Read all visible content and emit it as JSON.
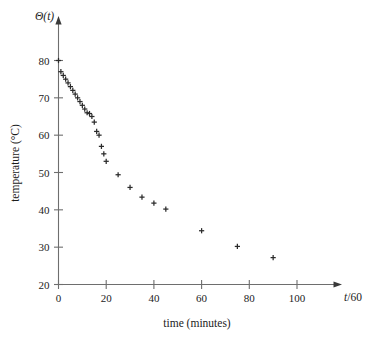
{
  "chart_data": {
    "type": "scatter",
    "title": "",
    "xlabel": "time (minutes)",
    "ylabel": "temperature (°C)",
    "x_axis_variable": "t/60",
    "y_axis_variable": "Θ(t)",
    "xlim": [
      0,
      115
    ],
    "ylim": [
      20,
      84
    ],
    "xticks": [
      0,
      20,
      40,
      60,
      80,
      100
    ],
    "xticklabels": [
      "0",
      "20",
      "40",
      "60",
      "80",
      "100"
    ],
    "yticks": [
      20,
      30,
      40,
      50,
      60,
      70,
      80
    ],
    "yticklabels": [
      "20",
      "30",
      "40",
      "50",
      "60",
      "70",
      "80"
    ],
    "grid": false,
    "legend": null,
    "marker": "plus",
    "marker_color": "#2b2b2b",
    "axis_color": "#6e6e6e",
    "x": [
      0,
      1,
      2,
      3,
      4,
      5,
      6,
      7,
      8,
      9,
      10,
      11,
      12,
      13,
      14,
      15,
      16,
      17,
      18,
      19,
      20,
      25,
      30,
      35,
      40,
      45,
      60,
      75,
      90
    ],
    "y": [
      80.0,
      77.0,
      76.0,
      75.0,
      74.0,
      73.0,
      72.0,
      71.0,
      70.0,
      69.0,
      68.0,
      67.0,
      66.0,
      65.8,
      65.0,
      63.5,
      61.0,
      60.0,
      57.0,
      55.0,
      53.0,
      49.4,
      46.0,
      43.4,
      41.8,
      40.2,
      34.4,
      30.2,
      27.2
    ],
    "series": [
      {
        "name": "temperature",
        "points": [
          {
            "t": 0,
            "T": 80.0
          },
          {
            "t": 1,
            "T": 77.0
          },
          {
            "t": 2,
            "T": 76.0
          },
          {
            "t": 3,
            "T": 75.0
          },
          {
            "t": 4,
            "T": 74.0
          },
          {
            "t": 5,
            "T": 73.0
          },
          {
            "t": 6,
            "T": 72.0
          },
          {
            "t": 7,
            "T": 71.0
          },
          {
            "t": 8,
            "T": 70.0
          },
          {
            "t": 9,
            "T": 69.0
          },
          {
            "t": 10,
            "T": 68.0
          },
          {
            "t": 11,
            "T": 67.0
          },
          {
            "t": 12,
            "T": 66.0
          },
          {
            "t": 13,
            "T": 65.8
          },
          {
            "t": 14,
            "T": 65.0
          },
          {
            "t": 15,
            "T": 63.5
          },
          {
            "t": 16,
            "T": 61.0
          },
          {
            "t": 17,
            "T": 60.0
          },
          {
            "t": 18,
            "T": 57.0
          },
          {
            "t": 19,
            "T": 55.0
          },
          {
            "t": 20,
            "T": 53.0
          },
          {
            "t": 25,
            "T": 49.4
          },
          {
            "t": 30,
            "T": 46.0
          },
          {
            "t": 35,
            "T": 43.4
          },
          {
            "t": 40,
            "T": 41.8
          },
          {
            "t": 45,
            "T": 40.2
          },
          {
            "t": 60,
            "T": 34.4
          },
          {
            "t": 75,
            "T": 30.2
          },
          {
            "t": 90,
            "T": 27.2
          }
        ]
      }
    ]
  },
  "figure": {
    "y_axis_variable_base": "Θ",
    "y_axis_variable_arg": "(t)",
    "x_axis_variable_num": "t",
    "x_axis_variable_rest": "/60",
    "xlabel": "time (minutes)",
    "ylabel": "temperature (°C)"
  }
}
